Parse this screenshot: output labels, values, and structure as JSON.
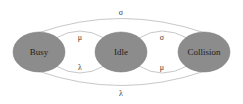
{
  "diagram": {
    "type": "state-transition",
    "colors": {
      "node_fill": "#8c8c8c",
      "node_stroke": "#7a7a7a",
      "edge_stroke": "#c8c8c8",
      "text": "#1e1e1e",
      "background": "#ffffff"
    },
    "states": [
      {
        "id": "busy",
        "label": "Busy"
      },
      {
        "id": "idle",
        "label": "Idle"
      },
      {
        "id": "collision",
        "label": "Collision"
      }
    ],
    "transitions": [
      {
        "from": "busy",
        "to": "idle",
        "label": "μ",
        "position": "inner-top-left"
      },
      {
        "from": "idle",
        "to": "busy",
        "label": "λ",
        "position": "inner-bottom-left"
      },
      {
        "from": "idle",
        "to": "collision",
        "label": "σ",
        "position": "inner-top-right"
      },
      {
        "from": "collision",
        "to": "idle",
        "label": "μ",
        "position": "inner-bottom-right"
      },
      {
        "from": "busy",
        "to": "collision",
        "label": "σ",
        "position": "outer-top"
      },
      {
        "from": "collision",
        "to": "busy",
        "label": "λ",
        "position": "outer-bottom"
      }
    ]
  }
}
